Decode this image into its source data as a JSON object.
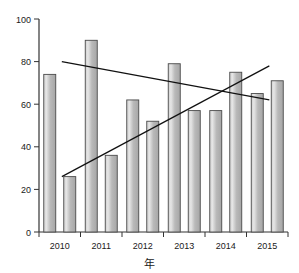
{
  "chart_data": {
    "type": "bar",
    "title": "",
    "xlabel": "年",
    "ylabel": "",
    "categories": [
      "2010",
      "2011",
      "2012",
      "2013",
      "2014",
      "2015"
    ],
    "ylim": [
      0,
      100
    ],
    "yticks": [
      0,
      20,
      40,
      60,
      80,
      100
    ],
    "ytick_labels": [
      "0",
      "20",
      "40",
      "60",
      "80",
      "100"
    ],
    "grid": false,
    "legend": "none",
    "series": [
      {
        "name": "series-a",
        "values": [
          74,
          90,
          62,
          79,
          57,
          65
        ]
      },
      {
        "name": "series-b",
        "values": [
          26,
          36,
          52,
          57,
          75,
          71
        ]
      }
    ],
    "bars": [
      {
        "label": "2010",
        "group": "a",
        "value": 74
      },
      {
        "label": "2010",
        "group": "b",
        "value": 26
      },
      {
        "label": "2011",
        "group": "a",
        "value": 90
      },
      {
        "label": "2011",
        "group": "b",
        "value": 36
      },
      {
        "label": "2012",
        "group": "a",
        "value": 62
      },
      {
        "label": "2012",
        "group": "b",
        "value": 52
      },
      {
        "label": "2013",
        "group": "a",
        "value": 79
      },
      {
        "label": "2013",
        "group": "b",
        "value": 57
      },
      {
        "label": "2014",
        "group": "a",
        "value": 57
      },
      {
        "label": "2014",
        "group": "b",
        "value": 75
      },
      {
        "label": "2015",
        "group": "a",
        "value": 65
      },
      {
        "label": "2015",
        "group": "b",
        "value": 71
      }
    ],
    "trendlines": [
      {
        "name": "declining-trend",
        "x0": 0.55,
        "y0": 80,
        "x1": 5.55,
        "y1": 62
      },
      {
        "name": "rising-trend",
        "x0": 0.55,
        "y0": 26,
        "x1": 5.55,
        "y1": 78
      }
    ],
    "colors": {
      "bar_fill_light": "#d9d9d9",
      "bar_fill_dark": "#a8a8a8",
      "bar_stroke": "#4a4a4a",
      "axis": "#333333",
      "trend": "#111111",
      "background": "#ffffff"
    }
  }
}
